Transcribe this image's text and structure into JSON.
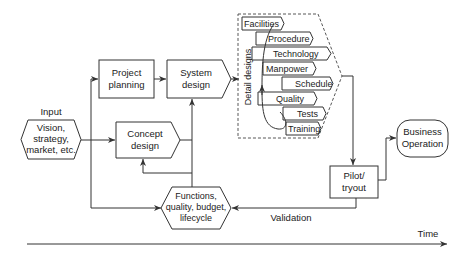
{
  "diagram": {
    "input_label": "Input",
    "input_node": [
      "Vision,",
      "strategy,",
      "market, etc."
    ],
    "project_planning": [
      "Project",
      "planning"
    ],
    "concept_design": [
      "Concept",
      "design"
    ],
    "system_design": [
      "System",
      "design"
    ],
    "functions_node": [
      "Functions,",
      "quality, budget,",
      "lifecycle"
    ],
    "detail_designs_label": "Detail designs",
    "detail_items": [
      "Facilities",
      "Procedure",
      "Technology",
      "Manpower",
      "Schedule",
      "Quality",
      "Tests",
      "Training"
    ],
    "pilot_tryout": [
      "Pilot/",
      "tryout"
    ],
    "business_operation": [
      "Business",
      "Operation"
    ],
    "validation_label": "Validation",
    "time_label": "Time"
  }
}
